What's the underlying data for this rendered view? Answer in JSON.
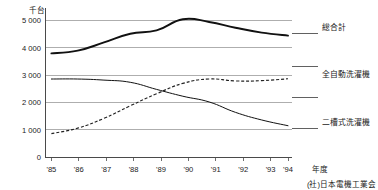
{
  "chart_data": {
    "type": "line",
    "title": "",
    "unit_label": "千台",
    "xlabel": "年度",
    "ylabel": "",
    "source": "(社)日本電機工業会",
    "grid": true,
    "legend_position": "right",
    "x": [
      "'85",
      "'86",
      "'87",
      "'88",
      "'89",
      "'90",
      "'91",
      "'92",
      "'93",
      "'94"
    ],
    "xticklabels": [
      "'85",
      "'86",
      "'87",
      "'88",
      "'89",
      "'90",
      "'91",
      "'92",
      "'93",
      "'94"
    ],
    "yticklabels": [
      "0",
      "1 000",
      "2 000",
      "3 000",
      "4 000",
      "5 000"
    ],
    "yticks": [
      0,
      1000,
      2000,
      3000,
      4000,
      5000
    ],
    "ylim": [
      0,
      5500
    ],
    "series": [
      {
        "name": "総合計",
        "style": "solid-thick",
        "color": "#111111",
        "values": [
          3800,
          3900,
          4200,
          4520,
          4640,
          5050,
          4950,
          4740,
          4560,
          4450
        ]
      },
      {
        "name": "全自動洗濯機",
        "style": "dashed",
        "color": "#222222",
        "values": [
          860,
          1060,
          1420,
          1880,
          2320,
          2700,
          2860,
          2790,
          2800,
          2870
        ]
      },
      {
        "name": "二槽式洗濯機",
        "style": "solid-thin",
        "color": "#111111",
        "values": [
          2860,
          2860,
          2820,
          2740,
          2480,
          2230,
          2020,
          1640,
          1360,
          1150
        ]
      }
    ]
  },
  "legend": {
    "items": [
      {
        "label": "総合計"
      },
      {
        "label": "全自動洗濯機"
      },
      {
        "label": "二槽式洗濯機"
      }
    ]
  },
  "axis": {
    "unit": "千台",
    "x_title": "年度"
  },
  "footer": {
    "source": "(社)日本電機工業会"
  }
}
